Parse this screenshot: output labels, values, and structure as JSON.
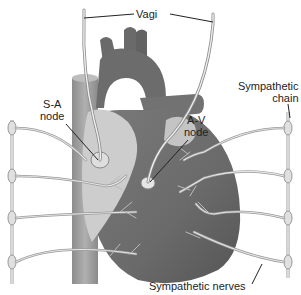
{
  "labels": {
    "vagi": "Vagi",
    "sa_node_line1": "S-A",
    "sa_node_line2": "node",
    "av_node_line1": "A-V",
    "av_node_line2": "node",
    "symp_chain_line1": "Sympathetic",
    "symp_chain_line2": "chain",
    "symp_nerves": "Sympathetic nerves"
  },
  "colors": {
    "heart_dark": "#6e6e6e",
    "heart_mid": "#8a8a8a",
    "atrium_light": "#cfcfcf",
    "nerve": "#c8c8c8",
    "nerve_edge": "#8c8c8c",
    "vessel": "#9a9a9a",
    "text": "#222222"
  }
}
